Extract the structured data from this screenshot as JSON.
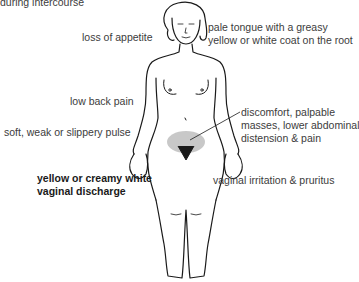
{
  "diagram": {
    "labels": {
      "top_cut": "during intercourse",
      "appetite": "loss of appetite",
      "tongue_line1": "pale tongue with a greasy",
      "tongue_line2": "yellow or white coat on the root",
      "back_pain": "low back pain",
      "pulse": "soft, weak or slippery pulse",
      "abdomen_line1": "discomfort, palpable",
      "abdomen_line2": "masses, lower abdominal",
      "abdomen_line3": "distension & pain",
      "discharge_line1": "yellow or creamy white",
      "discharge_line2": "vaginal discharge",
      "irritation": "vaginal irritation & pruritus"
    },
    "highlight_color": "#c8c8c8",
    "line_color": "#1a1a1a"
  }
}
